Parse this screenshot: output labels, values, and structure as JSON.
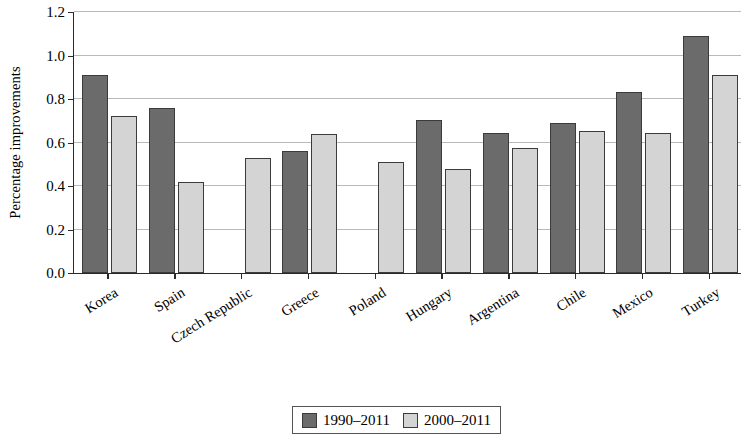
{
  "chart_data": {
    "type": "bar",
    "title": "",
    "xlabel": "",
    "ylabel": "Percentage improvements",
    "ylim": [
      0.0,
      1.2
    ],
    "ytick_labels": [
      "0.0",
      "0.2",
      "0.4",
      "0.6",
      "0.8",
      "1.0",
      "1.2"
    ],
    "ytick_values": [
      0.0,
      0.2,
      0.4,
      0.6,
      0.8,
      1.0,
      1.2
    ],
    "grid": true,
    "legend_position": "bottom-center",
    "categories": [
      "Korea",
      "Spain",
      "Czech Republic",
      "Greece",
      "Poland",
      "Hungary",
      "Argentina",
      "Chile",
      "Mexico",
      "Turkey"
    ],
    "series": [
      {
        "name": "1990–2011",
        "color": "#6b6b6b",
        "values": [
          0.91,
          0.76,
          null,
          0.56,
          null,
          0.705,
          0.645,
          0.69,
          0.83,
          1.09
        ]
      },
      {
        "name": "2000–2011",
        "color": "#d4d4d4",
        "values": [
          0.72,
          0.42,
          0.53,
          0.64,
          0.51,
          0.48,
          0.575,
          0.655,
          0.645,
          0.91
        ]
      }
    ]
  }
}
